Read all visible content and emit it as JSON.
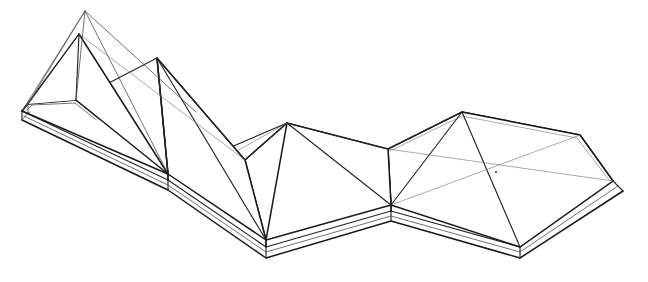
{
  "document": {
    "title": "Axonometric line drawing of a multi-bay tensile canopy roof on a raised slab",
    "drawing_type": "architectural axonometric wireframe",
    "canvas": {
      "width": 648,
      "height": 282
    },
    "background_color": "#ffffff",
    "line_color_heavy": "#1a1a1a",
    "line_color_medium": "#262626",
    "line_color_light": "#4d4d4d",
    "line_color_hair": "#6e6e6e"
  },
  "geometry": {
    "slab_top_outline": [
      [
        22,
        111
      ],
      [
        28,
        104
      ],
      [
        76,
        100
      ],
      [
        168,
        174
      ],
      [
        266,
        240
      ],
      [
        391,
        205
      ],
      [
        462,
        112
      ],
      [
        580,
        135
      ],
      [
        613,
        181
      ],
      [
        520,
        247
      ],
      [
        391,
        211
      ],
      [
        266,
        247
      ],
      [
        168,
        180
      ]
    ],
    "slab_front_outline": [
      [
        22,
        120
      ],
      [
        168,
        190
      ],
      [
        266,
        258
      ],
      [
        391,
        221
      ],
      [
        520,
        258
      ],
      [
        623,
        191
      ],
      [
        613,
        188
      ]
    ],
    "slab_thickness_px": 10,
    "modules": [
      {
        "name": "left-bay-twin-peak",
        "peaks": [
          {
            "id": "peak-a-outer",
            "x": 85,
            "y": 11,
            "label": "tall outer mast peak"
          },
          {
            "id": "peak-a-inner",
            "x": 79,
            "y": 34,
            "label": "tall inner mast peak"
          }
        ],
        "base_corners": [
          [
            28,
            104
          ],
          [
            76,
            100
          ],
          [
            168,
            174
          ],
          [
            168,
            180
          ],
          [
            22,
            111
          ]
        ]
      },
      {
        "name": "mid-left-bay-peak",
        "peaks": [
          {
            "id": "peak-b",
            "x": 157,
            "y": 58,
            "label": "second mast peak"
          }
        ],
        "base_corners": [
          [
            168,
            174
          ],
          [
            266,
            240
          ],
          [
            245,
            160
          ]
        ]
      },
      {
        "name": "center-bay-peak",
        "peaks": [
          {
            "id": "peak-c",
            "x": 287,
            "y": 123,
            "label": "third mast peak"
          }
        ],
        "base_corners": [
          [
            266,
            240
          ],
          [
            391,
            205
          ],
          [
            391,
            211
          ],
          [
            245,
            160
          ]
        ]
      },
      {
        "name": "right-bay-hipped",
        "peaks": [
          {
            "id": "ridge-left",
            "x": 462,
            "y": 112,
            "label": "right bay ridge left end"
          },
          {
            "id": "ridge-right",
            "x": 580,
            "y": 135,
            "label": "right bay ridge right end"
          },
          {
            "id": "hip-center",
            "x": 496,
            "y": 172,
            "label": "hip diagonals crossing point"
          }
        ],
        "base_corners": [
          [
            391,
            205
          ],
          [
            462,
            112
          ],
          [
            580,
            135
          ],
          [
            613,
            181
          ],
          [
            520,
            247
          ],
          [
            391,
            211
          ]
        ]
      }
    ],
    "valley_points": [
      {
        "id": "valley-left",
        "x": 168,
        "y": 174
      },
      {
        "id": "valley-mid",
        "x": 266,
        "y": 240
      },
      {
        "id": "valley-right",
        "x": 391,
        "y": 205
      },
      {
        "id": "valley-upper",
        "x": 245,
        "y": 160
      },
      {
        "id": "valley-hip",
        "x": 388,
        "y": 149
      }
    ]
  },
  "annotations": {
    "labels": [],
    "dimensions": [],
    "legend": []
  }
}
